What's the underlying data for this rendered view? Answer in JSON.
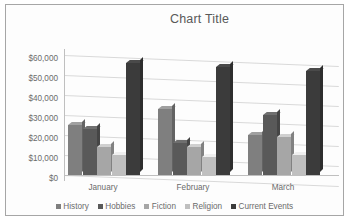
{
  "chart": {
    "title": "Chart Title",
    "border_color": "#a6a6a6",
    "plot_background": "#fdfdfd",
    "gridline_color": "#d9d9d9",
    "axis_color": "#bfbfbf",
    "text_color": "#6b6b6b"
  },
  "chart_data": {
    "type": "bar",
    "title": "Chart Title",
    "xlabel": "",
    "ylabel": "",
    "categories": [
      "January",
      "February",
      "March"
    ],
    "ylim": [
      0,
      60000
    ],
    "yticks": [
      0,
      10000,
      20000,
      30000,
      40000,
      50000,
      60000
    ],
    "ytick_labels": [
      "$0",
      "$10,000",
      "$20,000",
      "$30,000",
      "$40,000",
      "$50,000",
      "$60,000"
    ],
    "grid": true,
    "legend_position": "bottom",
    "three_d": true,
    "series": [
      {
        "name": "History",
        "color": "#7f7f7f",
        "values": [
          25000,
          33000,
          20000
        ]
      },
      {
        "name": "Hobbies",
        "color": "#595959",
        "values": [
          23000,
          16000,
          30000
        ]
      },
      {
        "name": "Fiction",
        "color": "#a6a6a6",
        "values": [
          14000,
          14000,
          19000
        ]
      },
      {
        "name": "Religion",
        "color": "#bfbfbf",
        "values": [
          10000,
          9000,
          10000
        ]
      },
      {
        "name": "Current Events",
        "color": "#3b3b3b",
        "values": [
          56000,
          54000,
          52000
        ]
      }
    ]
  }
}
